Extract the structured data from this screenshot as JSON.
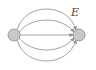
{
  "diagram": {
    "type": "multigraph",
    "nodes": [
      {
        "id": "left",
        "cx": 14,
        "cy": 35,
        "r": 6,
        "fill": "#c8c8c8"
      },
      {
        "id": "right",
        "cx": 79,
        "cy": 35,
        "r": 6,
        "fill": "#c8c8c8"
      }
    ],
    "edges": [
      {
        "from": "left",
        "to": "right",
        "style": "arc-top-outer"
      },
      {
        "from": "left",
        "to": "right",
        "style": "arc-top-inner"
      },
      {
        "from": "left",
        "to": "right",
        "style": "straight"
      },
      {
        "from": "left",
        "to": "right",
        "style": "arc-bottom-inner"
      },
      {
        "from": "left",
        "to": "right",
        "style": "arc-bottom-outer"
      }
    ],
    "edge_label": "E",
    "edge_color": "#8a8a8a"
  }
}
